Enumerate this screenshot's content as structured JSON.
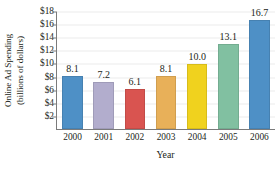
{
  "chart_data": {
    "type": "bar",
    "title": "",
    "xlabel": "Year",
    "ylabel_line1": "Online Ad Spending",
    "ylabel_line2": "(billions of dollars)",
    "categories": [
      "2000",
      "2001",
      "2002",
      "2003",
      "2004",
      "2005",
      "2006"
    ],
    "values": [
      8.1,
      7.2,
      6.1,
      8.1,
      10.0,
      13.1,
      16.7
    ],
    "value_labels": [
      "8.1",
      "7.2",
      "6.1",
      "8.1",
      "10.0",
      "13.1",
      "16.7"
    ],
    "bar_colors": [
      "#4e90c6",
      "#b2adcd",
      "#d95450",
      "#e8b059",
      "#f0d21e",
      "#81c0a1",
      "#4e90c6"
    ],
    "ylim": [
      0,
      18
    ],
    "ytick_values": [
      2,
      4,
      6,
      8,
      10,
      12,
      14,
      16,
      18
    ],
    "ytick_labels": [
      "$2",
      "$4",
      "$6",
      "$8",
      "$10",
      "$12",
      "$14",
      "$16",
      "$18"
    ],
    "grid": true,
    "grid_color": "#ececec",
    "axis_color": "#7b7b7b",
    "legend": "none",
    "background": "#ffffff"
  }
}
